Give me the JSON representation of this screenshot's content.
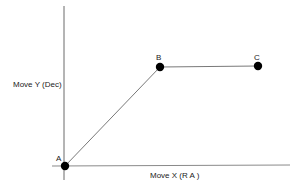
{
  "diagram": {
    "axes": {
      "x_label": "Move X (R A )",
      "y_label": "Move Y (Dec)"
    },
    "points": [
      {
        "id": "A",
        "label": "A",
        "x": 65,
        "y": 166
      },
      {
        "id": "B",
        "label": "B",
        "x": 160,
        "y": 67
      },
      {
        "id": "C",
        "label": "C",
        "x": 258,
        "y": 66
      }
    ],
    "path": [
      "A",
      "B",
      "C"
    ],
    "colors": {
      "axis": "#6a6a6a",
      "path": "#555555",
      "point": "#000000",
      "text": "#222222"
    }
  }
}
